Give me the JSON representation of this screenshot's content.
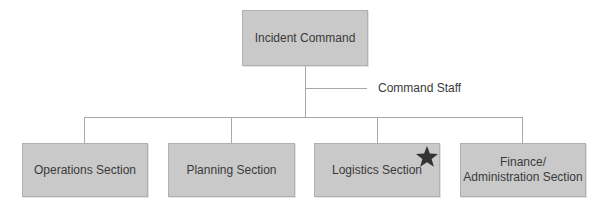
{
  "diagram": {
    "type": "org-chart",
    "title_node": {
      "label": "Incident Command"
    },
    "staff_branch": {
      "label": "Command Staff"
    },
    "sections": [
      {
        "label": "Operations Section",
        "highlighted": false
      },
      {
        "label": "Planning Section",
        "highlighted": false
      },
      {
        "label": "Logistics Section",
        "highlighted": true,
        "marker": "star-icon"
      },
      {
        "label": "Finance/ Administration Section",
        "line1": "Finance/",
        "line2": "Administration Section",
        "highlighted": false
      }
    ],
    "colors": {
      "box_fill": "#c9c9c9",
      "text": "#3a3a3a",
      "connector": "#a8a8a8",
      "star": "#333333"
    }
  }
}
